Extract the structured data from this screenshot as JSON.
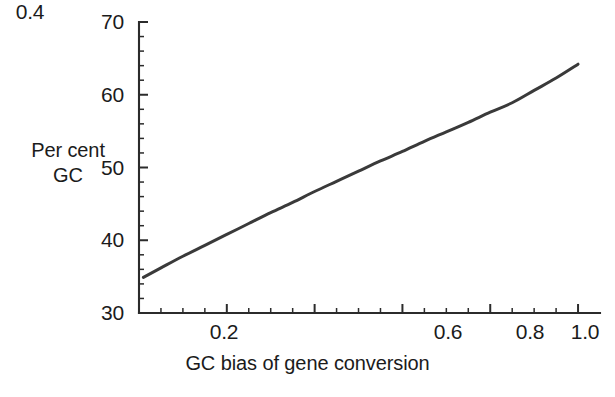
{
  "chart_data": {
    "type": "line",
    "title": "",
    "xlabel": "GC bias of gene conversion",
    "ylabel_line1": "Per cent",
    "ylabel_line2": "GC",
    "xlim": [
      0.0,
      1.05
    ],
    "ylim": [
      30,
      70
    ],
    "grid": false,
    "legend": "none",
    "x_major_ticks": [
      0.2,
      0.4,
      0.6,
      0.8,
      1.0
    ],
    "x_major_tick_labels": [
      "0.2",
      "0.4",
      "0.6",
      "0.8",
      "1.0"
    ],
    "x_minor_tick_step": 0.05,
    "y_major_ticks": [
      30,
      40,
      50,
      60,
      70
    ],
    "y_major_tick_labels": [
      "30",
      "40",
      "50",
      "60",
      "70"
    ],
    "y_minor_tick_step": 2,
    "line_color": "#3a3a3a",
    "axis_color": "#2b2b2b",
    "series": [
      {
        "name": "Per cent GC vs GC bias",
        "x": [
          0.01,
          0.05,
          0.1,
          0.15,
          0.2,
          0.25,
          0.3,
          0.35,
          0.4,
          0.45,
          0.5,
          0.55,
          0.6,
          0.65,
          0.7,
          0.75,
          0.8,
          0.85,
          0.9,
          0.95,
          1.0
        ],
        "y": [
          34.9,
          36.2,
          37.8,
          39.3,
          40.8,
          42.3,
          43.8,
          45.2,
          46.7,
          48.1,
          49.5,
          50.9,
          52.2,
          53.6,
          54.9,
          56.2,
          57.6,
          58.9,
          60.6,
          62.3,
          64.2
        ]
      }
    ]
  },
  "axes": {
    "y_labels": [
      "70",
      "60",
      "50",
      "40",
      "30"
    ],
    "x_labels": [
      "0.2",
      "0.4",
      "0.6",
      "0.8",
      "1.0"
    ]
  }
}
